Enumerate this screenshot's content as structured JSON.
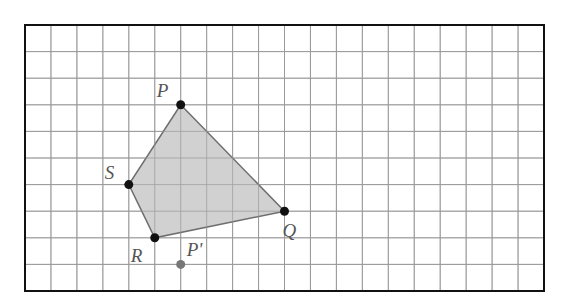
{
  "diagram": {
    "type": "grid-geometry",
    "grid": {
      "columns": 20,
      "rows": 10,
      "line_color": "#9a9a9a",
      "frame_color": "#111111"
    },
    "shape": {
      "name": "quadrilateral PQRS",
      "fill": "#c9c9c9",
      "stroke": "#6e6e6e",
      "vertices": [
        "P",
        "Q",
        "R",
        "S"
      ]
    },
    "points": [
      {
        "id": "P",
        "label": "P",
        "col": 6,
        "row": 3,
        "color": "#111111",
        "label_dx": -24,
        "label_dy": -8
      },
      {
        "id": "Q",
        "label": "Q",
        "col": 10,
        "row": 7,
        "color": "#111111",
        "label_dx": -2,
        "label_dy": 26
      },
      {
        "id": "R",
        "label": "R",
        "col": 5,
        "row": 8,
        "color": "#111111",
        "label_dx": -24,
        "label_dy": 24
      },
      {
        "id": "S",
        "label": "S",
        "col": 4,
        "row": 6,
        "color": "#111111",
        "label_dx": -24,
        "label_dy": -6
      },
      {
        "id": "P'",
        "label": "P'",
        "col": 6,
        "row": 9,
        "color": "#777777",
        "label_dx": 6,
        "label_dy": -8
      }
    ]
  }
}
